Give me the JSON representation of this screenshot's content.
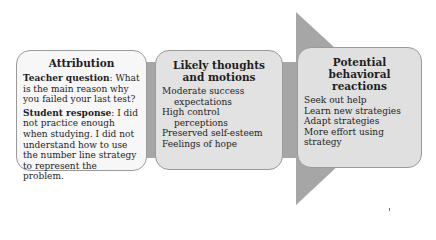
{
  "diagram": {
    "type": "process-arrow",
    "colors": {
      "arrow_fill": "#a6a6a6",
      "box1_fill": "#f7f7f7",
      "box2_fill": "#e2e2e2",
      "box3_fill": "#e0e0e0",
      "box_border": "#9a9a9a",
      "text": "#1e1e1e"
    },
    "boxes": [
      {
        "title": "Attribution",
        "teacher_label": "Teacher question",
        "teacher_text": ": What is the main reason why you failed your last test?",
        "student_label": "Student response",
        "student_text": ": I did not practice enough when studying. I did not understand how to use the number line strategy to represent the problem."
      },
      {
        "title": "Likely thoughts and motions",
        "items": [
          "Moderate success expectations",
          "High control perceptions",
          "Preserved self-esteem",
          "Feelings of hope"
        ]
      },
      {
        "title": "Potential behavioral reactions",
        "items": [
          "Seek out help",
          "Learn new strategies",
          "Adapt strategies",
          "More effort using strategy"
        ]
      }
    ]
  }
}
